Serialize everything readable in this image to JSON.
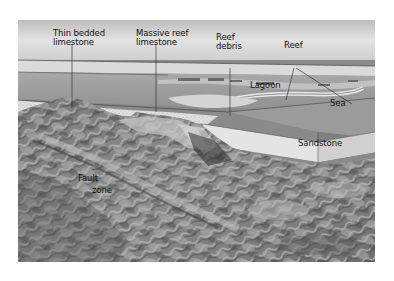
{
  "figure": {
    "type": "block diagram",
    "style": "grayscale shaded-relief illustration",
    "labels": {
      "thin_bedded_1": "Thin bedded",
      "thin_bedded_2": "limestone",
      "massive_reef_1": "Massive reef",
      "massive_reef_2": "limestone",
      "reef_debris_1": "Reef",
      "reef_debris_2": "debris",
      "reef": "Reef",
      "lagoon": "Lagoon",
      "sea": "Sea",
      "sandstone": "Sandstone",
      "fault_1": "Fault",
      "fault_2": "zone"
    }
  }
}
